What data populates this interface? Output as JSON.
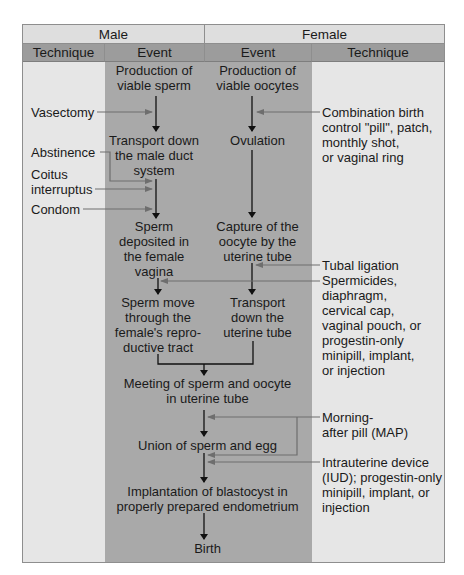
{
  "header": {
    "male": "Male",
    "female": "Female",
    "male_technique": "Technique",
    "male_event": "Event",
    "female_event": "Event",
    "female_technique": "Technique"
  },
  "male_events": {
    "production": [
      "Production of",
      "viable sperm"
    ],
    "transport": [
      "Transport down",
      "the male duct",
      "system"
    ],
    "deposited": [
      "Sperm",
      "deposited in",
      "the female",
      "vagina"
    ],
    "move": [
      "Sperm move",
      "through the",
      "female's repro-",
      "ductive tract"
    ]
  },
  "female_events": {
    "production": [
      "Production of",
      "viable oocytes"
    ],
    "ovulation": [
      "Ovulation"
    ],
    "capture": [
      "Capture of the",
      "oocyte by the",
      "uterine tube"
    ],
    "transport": [
      "Transport",
      "down the",
      "uterine tube"
    ]
  },
  "shared_events": {
    "meeting": [
      "Meeting of sperm and oocyte",
      "in uterine tube"
    ],
    "union": [
      "Union of sperm and egg"
    ],
    "implantation": [
      "Implantation of blastocyst in",
      "properly prepared endometrium"
    ],
    "birth": [
      "Birth"
    ]
  },
  "male_techniques": {
    "vasectomy": [
      "Vasectomy"
    ],
    "abstinence": [
      "Abstinence"
    ],
    "coitus": [
      "Coitus",
      "interruptus"
    ],
    "condom": [
      "Condom"
    ]
  },
  "female_techniques": {
    "combination": [
      "Combination birth",
      "control \"pill\", patch,",
      "monthly shot,",
      "or vaginal ring"
    ],
    "tubal": [
      "Tubal ligation"
    ],
    "spermicides": [
      "Spermicides,",
      "diaphragm,",
      "cervical cap,",
      "vaginal pouch, or",
      "progestin-only",
      "minipill, implant,",
      "or injection"
    ],
    "map": [
      "Morning-",
      "after pill (MAP)"
    ],
    "iud": [
      "Intrauterine device",
      "(IUD); progestin-only",
      "minipill, implant, or",
      "injection"
    ]
  },
  "colors": {
    "technique_bg": "#e6e6e6",
    "event_bg": "#a9a9a9",
    "header_top_bg": "#dedede",
    "header_sub_bg": "#9c9c9c",
    "flow_arrow": "#111111",
    "technique_arrow": "#6e6e6e"
  }
}
